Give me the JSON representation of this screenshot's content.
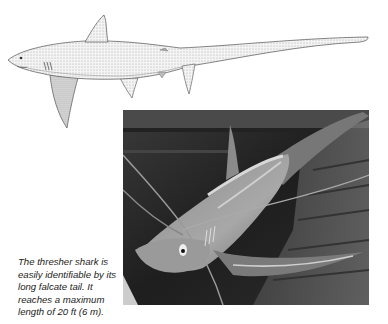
{
  "figure": {
    "illustration": {
      "subject": "thresher shark",
      "style": "stippled pen-and-ink drawing, side view"
    },
    "photo": {
      "subject": "thresher shark on boat deck, tied with ropes",
      "style": "black-and-white photograph"
    },
    "caption": "The thresher shark is easily identifiable by its long falcate tail. It reaches a maximum length of 20 ft (6 m)."
  },
  "colors": {
    "background": "#ffffff",
    "caption_text": "#222222",
    "ink": "#555555"
  }
}
